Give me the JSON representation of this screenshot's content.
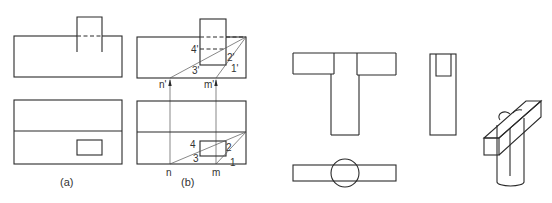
{
  "figure_a": {
    "caption": "(a)",
    "front_view": {
      "outer": [
        14,
        36,
        108,
        41
      ],
      "prism": [
        77,
        17,
        25,
        35
      ]
    },
    "top_view": {
      "outer": [
        14,
        100,
        108,
        64
      ],
      "mid_y": 131,
      "hole": [
        77,
        140,
        25,
        15
      ]
    }
  },
  "figure_b": {
    "caption": "(b)",
    "front_labels": {
      "p4": "4'",
      "p2": "2'",
      "p3": "3'",
      "p1": "1'",
      "n": "n'",
      "m": "m'"
    },
    "top_labels": {
      "p4": "4",
      "p2": "2",
      "p3": "3",
      "p1": "1",
      "n": "n",
      "m": "m"
    }
  },
  "figure_c": {
    "description": "T-shaped front view with top view showing cylinder and bar"
  },
  "figure_d": {
    "description": "side view and isometric of cylinder with crossbar"
  },
  "colors": {
    "line": "#2a2a2a",
    "background": "#ffffff"
  }
}
